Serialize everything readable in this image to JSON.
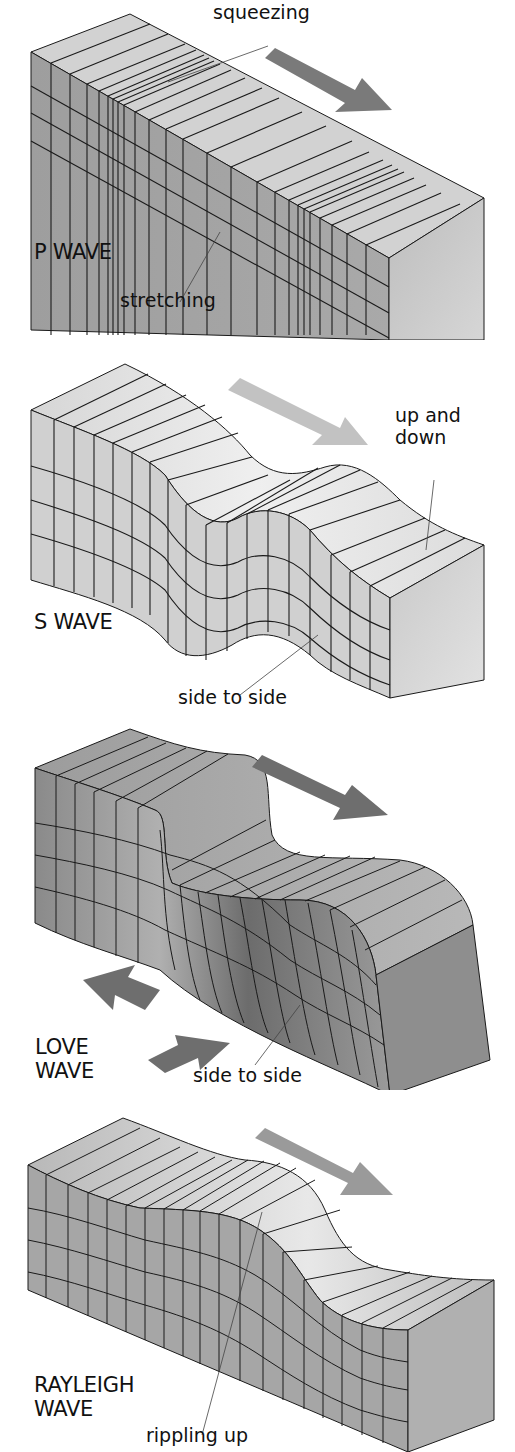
{
  "figure": {
    "panels": [
      {
        "id": "p-wave",
        "title": "P WAVE",
        "annotations": [
          "squeezing",
          "stretching"
        ],
        "motion_arrows": [
          "direction-of-travel-arrow"
        ]
      },
      {
        "id": "s-wave",
        "title": "S WAVE",
        "annotations": [
          "up and\ndown",
          "side to side"
        ],
        "motion_arrows": [
          "direction-of-travel-arrow"
        ]
      },
      {
        "id": "love-wave",
        "title": "LOVE\nWAVE",
        "annotations": [
          "side to side"
        ],
        "motion_arrows": [
          "direction-of-travel-arrow",
          "left-arrow",
          "right-arrow"
        ]
      },
      {
        "id": "rayleigh-wave",
        "title": "RAYLEIGH\nWAVE",
        "annotations": [
          "rippling up"
        ],
        "motion_arrows": [
          "direction-of-travel-arrow"
        ]
      }
    ]
  },
  "colors": {
    "top_face_light": "#d9d9d9",
    "front_face": "#a8a8a8",
    "end_face": "#c4c4c4",
    "arrow_dark": "#6e6e6e",
    "arrow_light": "#bdbdbd",
    "grid_line": "#1a1a1a",
    "text": "#111111"
  }
}
